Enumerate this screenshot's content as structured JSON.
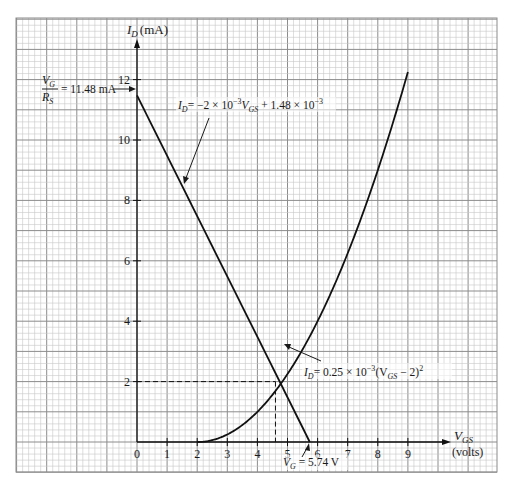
{
  "chart_data": {
    "type": "line",
    "title": "",
    "xlabel": "V_GS (volts)",
    "ylabel": "I_D (mA)",
    "xlim": [
      0,
      9
    ],
    "ylim": [
      0,
      12
    ],
    "x_ticks": [
      0,
      1,
      2,
      3,
      4,
      5,
      6,
      7,
      8,
      9
    ],
    "y_ticks": [
      2,
      4,
      6,
      8,
      10,
      12
    ],
    "grid": true,
    "series": [
      {
        "name": "Load line: I_D = -2 × 10^-3 V_GS + 1.48 × 10^-3",
        "kind": "straight-line",
        "points": [
          [
            0,
            11.48
          ],
          [
            5.74,
            0
          ]
        ]
      },
      {
        "name": "Transfer curve: I_D = 0.25 × 10^-3 (V_GS - 2)^2",
        "kind": "parabola",
        "k": 0.25,
        "vt": 2,
        "x_range": [
          2,
          9
        ],
        "points": [
          [
            2,
            0
          ],
          [
            3,
            0.25
          ],
          [
            4,
            1
          ],
          [
            4.57,
            1.65
          ],
          [
            5,
            2.25
          ],
          [
            6,
            4
          ],
          [
            7,
            6.25
          ],
          [
            8,
            9
          ],
          [
            9,
            12.25
          ]
        ]
      }
    ],
    "operating_point": {
      "V_GS": 4.6,
      "I_D": 2
    },
    "annotations": [
      {
        "text_parts": [
          "V",
          "G",
          "R",
          "S",
          "= 11.48 mA"
        ],
        "points_to": [
          0,
          11.48
        ]
      },
      {
        "text": "I_D = -2 × 10^-3 V_GS + 1.48 × 10^-3",
        "points_to": "load line"
      },
      {
        "text": "I_D = 0.25 × 10^-3 (V_GS - 2)^2",
        "points_to": "transfer curve"
      },
      {
        "text": "V_G = 5.74 V",
        "points_to": [
          5.74,
          0
        ]
      }
    ]
  },
  "axes": {
    "y_label_main": "I",
    "y_label_sub": "D",
    "y_label_unit": "(mA)",
    "x_label_main": "V",
    "x_label_sub": "GS",
    "x_label_unit": "(volts)",
    "x_tick_labels": [
      "0",
      "1",
      "2",
      "3",
      "4",
      "5",
      "6",
      "7",
      "8",
      "9"
    ],
    "y_tick_labels": [
      "2",
      "4",
      "6",
      "8",
      "10",
      "12"
    ]
  },
  "labels": {
    "vg_over_rs": {
      "num_main": "V",
      "num_sub": "G",
      "den_main": "R",
      "den_sub": "S",
      "value": "= 11.48 mA"
    },
    "load_line_eq": {
      "lhs_main": "I",
      "lhs_sub": "D",
      "rhs_a": "= −2 × 10",
      "rhs_a_exp": "−3",
      "rhs_b": "V",
      "rhs_b_sub": "GS",
      "rhs_c": " + 1.48 × 10",
      "rhs_c_exp": "−3"
    },
    "transfer_eq": {
      "lhs_main": "I",
      "lhs_sub": "D",
      "rhs_a": "= 0.25 × 10",
      "rhs_a_exp": "−3",
      "rhs_b": "(V",
      "rhs_b_sub": "GS",
      "rhs_c": " − 2)",
      "rhs_c_exp": "2"
    },
    "vg_value": {
      "main": "V",
      "sub": "G",
      "value": " = 5.74 V"
    }
  },
  "colors": {
    "grid_major": "#8c8c8c",
    "grid_minor": "#c8c8c8",
    "curve": "#111111",
    "text": "#1a1a1a"
  }
}
